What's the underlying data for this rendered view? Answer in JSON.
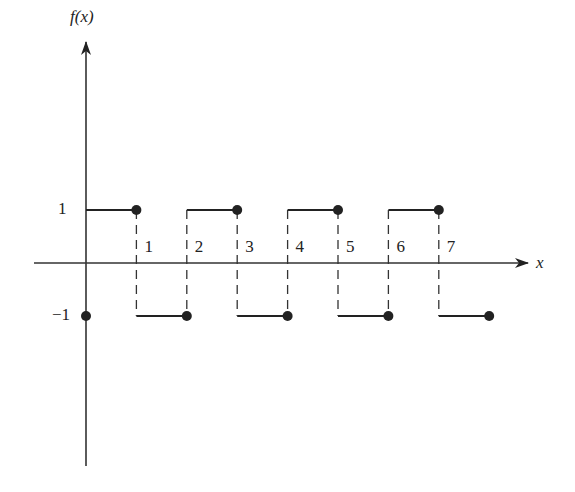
{
  "axes": {
    "y_label": "f(x)",
    "x_label": "x",
    "y_tick_labels": [
      "1",
      "−1"
    ],
    "x_tick_labels": [
      "1",
      "2",
      "3",
      "4",
      "5",
      "6",
      "7"
    ]
  },
  "function": {
    "period": 2,
    "segments": [
      {
        "x_start": 0,
        "x_end": 1,
        "y": 1
      },
      {
        "x_start": 1,
        "x_end": 2,
        "y": -1
      },
      {
        "x_start": 2,
        "x_end": 3,
        "y": 1
      },
      {
        "x_start": 3,
        "x_end": 4,
        "y": -1
      },
      {
        "x_start": 4,
        "x_end": 5,
        "y": 1
      },
      {
        "x_start": 5,
        "x_end": 6,
        "y": -1
      },
      {
        "x_start": 6,
        "x_end": 7,
        "y": 1
      },
      {
        "x_start": 7,
        "x_end": 8,
        "y": -1
      }
    ],
    "closed_points": [
      [
        0,
        -1
      ],
      [
        1,
        1
      ],
      [
        2,
        -1
      ],
      [
        3,
        1
      ],
      [
        4,
        -1
      ],
      [
        5,
        1
      ],
      [
        6,
        -1
      ],
      [
        7,
        1
      ],
      [
        8,
        -1
      ]
    ]
  },
  "colors": {
    "line": "#222222",
    "background": "#ffffff"
  }
}
